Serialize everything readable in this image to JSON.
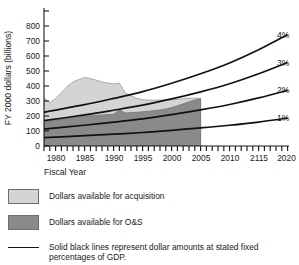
{
  "figure": {
    "axis": {
      "ylabel": "FY 2000 dollars (billions)",
      "xlabel": "Fiscal Year",
      "yticks": [
        "0",
        "100",
        "200",
        "300",
        "400",
        "500",
        "600",
        "700",
        "800"
      ],
      "xticks": [
        "1980",
        "1985",
        "1990",
        "1995",
        "2000",
        "2005",
        "2010",
        "2115",
        "2020"
      ]
    },
    "curve_labels": {
      "p4": "4%",
      "p3": "3%",
      "p2": "2%",
      "p1": "1%"
    },
    "legend": {
      "acquisition": "Dollars available for acquisition",
      "ons": "Dollars available for O&S",
      "note": "Solid black lines represent dollar amounts at stated fixed\npercentages of GDP."
    },
    "colors": {
      "acquisition_fill": "#d4d4d4",
      "ons_fill": "#8a8a8a",
      "line": "#111111",
      "axis": "#1a1a1a",
      "edge": "#6e6e6e"
    }
  },
  "chart_data": {
    "type": "area",
    "title": "",
    "xlabel": "Fiscal Year",
    "ylabel": "FY 2000 dollars (billions)",
    "xlim": [
      1978,
      2020
    ],
    "ylim": [
      0,
      800
    ],
    "grid": false,
    "legend_position": "below",
    "xticklabels": [
      "1980",
      "1985",
      "1990",
      "1995",
      "2000",
      "2005",
      "2010",
      "2115",
      "2020"
    ],
    "xtickvalues": [
      1980,
      1985,
      1990,
      1995,
      2000,
      2005,
      2010,
      2015,
      2020
    ],
    "yticks": [
      0,
      100,
      200,
      300,
      400,
      500,
      600,
      700,
      800
    ],
    "stacked_areas": {
      "x": [
        1978,
        1979,
        1980,
        1981,
        1982,
        1983,
        1984,
        1985,
        1986,
        1987,
        1988,
        1989,
        1990,
        1991,
        1992,
        1993,
        1994,
        1995,
        1996,
        1997,
        1998,
        1999,
        2000,
        2001,
        2002,
        2003,
        2004,
        2005
      ],
      "ons": {
        "name": "Dollars available for O&S",
        "color": "#8a8a8a",
        "values": [
          145,
          148,
          152,
          158,
          163,
          168,
          172,
          176,
          180,
          182,
          184,
          186,
          188,
          215,
          196,
          198,
          200,
          203,
          206,
          210,
          214,
          220,
          228,
          238,
          250,
          262,
          272,
          280
        ]
      },
      "acquisition": {
        "name": "Dollars available for acquisition",
        "color": "#d4d4d4",
        "values": [
          140,
          110,
          128,
          158,
          190,
          212,
          222,
          230,
          220,
          208,
          196,
          188,
          180,
          158,
          118,
          100,
          82,
          72,
          66,
          62,
          58,
          52,
          46,
          38,
          30,
          22,
          12,
          2
        ]
      },
      "total": {
        "name": "Total (acquisition + O&S)",
        "values": [
          285,
          258,
          280,
          316,
          353,
          380,
          394,
          406,
          400,
          390,
          380,
          374,
          368,
          373,
          314,
          298,
          282,
          275,
          272,
          272,
          272,
          272,
          274,
          276,
          280,
          284,
          284,
          282
        ]
      }
    },
    "gdp_lines": [
      {
        "name": "4%",
        "label": "4%",
        "color": "#111111",
        "x": [
          1978,
          1985,
          1990,
          1995,
          2000,
          2005,
          2010,
          2015,
          2020
        ],
        "values": [
          200,
          245,
          282,
          322,
          372,
          428,
          492,
          570,
          660
        ]
      },
      {
        "name": "3%",
        "label": "3%",
        "color": "#111111",
        "x": [
          1978,
          1985,
          1990,
          1995,
          2000,
          2005,
          2010,
          2015,
          2020
        ],
        "values": [
          150,
          184,
          212,
          242,
          279,
          321,
          369,
          428,
          495
        ]
      },
      {
        "name": "2%",
        "label": "2%",
        "color": "#111111",
        "x": [
          1978,
          1985,
          1990,
          1995,
          2000,
          2005,
          2010,
          2015,
          2020
        ],
        "values": [
          100,
          123,
          141,
          161,
          186,
          214,
          246,
          285,
          330
        ]
      },
      {
        "name": "1%",
        "label": "1%",
        "color": "#111111",
        "x": [
          1978,
          1985,
          1990,
          1995,
          2000,
          2005,
          2010,
          2015,
          2020
        ],
        "values": [
          50,
          61,
          70,
          80,
          93,
          107,
          123,
          142,
          165
        ]
      }
    ]
  }
}
